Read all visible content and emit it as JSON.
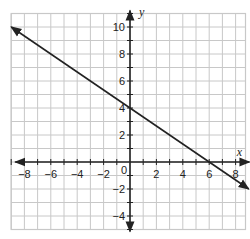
{
  "chart_data": {
    "type": "line",
    "title": "",
    "xlabel": "x",
    "ylabel": "y",
    "xlim": [
      -9,
      8.75
    ],
    "ylim": [
      -5,
      11
    ],
    "grid": true,
    "grid_step": 1,
    "x_ticks": [
      -8,
      -6,
      -4,
      -2,
      0,
      2,
      4,
      6,
      8
    ],
    "x_tick_labels": [
      "−8",
      "−6",
      "−4",
      "−2",
      "0",
      "2",
      "4",
      "6",
      "8"
    ],
    "y_ticks": [
      -4,
      -2,
      2,
      4,
      6,
      8,
      10
    ],
    "y_tick_labels": [
      "−4",
      "−2",
      "2",
      "4",
      "6",
      "8",
      "10"
    ],
    "series": [
      {
        "name": "line",
        "equation": "y = -2/3 x + 4",
        "x": [
          -9,
          0,
          6,
          9
        ],
        "y": [
          10,
          4,
          0,
          -2
        ],
        "arrows": "both",
        "color": "#222222"
      }
    ],
    "points_of_interest": [
      {
        "label": "y-intercept",
        "x": 0,
        "y": 4
      },
      {
        "label": "x-intercept",
        "x": 6,
        "y": 0
      }
    ]
  },
  "colors": {
    "grid": "#c8c8c8",
    "axis": "#222222",
    "line": "#222222"
  }
}
